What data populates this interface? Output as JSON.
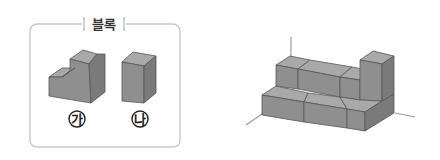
{
  "legend": {
    "title": "블록",
    "pieces": [
      {
        "id": "ga",
        "label": "가",
        "shape": "L-shaped step block (2 wide, tall on right)"
      },
      {
        "id": "na",
        "label": "나",
        "shape": "tall rectangular prism"
      }
    ]
  },
  "assembly": {
    "description": "Stepped structure built from blocks on 3D axes",
    "bottom_row_blocks": 3,
    "top_row_blocks": 3,
    "tower_blocks": 1
  },
  "colors": {
    "frame": "#c8c8c8",
    "top_face": "#a9a9a9",
    "front_face": "#8f8f8f",
    "side_face": "#7a7a7a",
    "edge": "#555555",
    "axis": "#9a9a9a"
  }
}
